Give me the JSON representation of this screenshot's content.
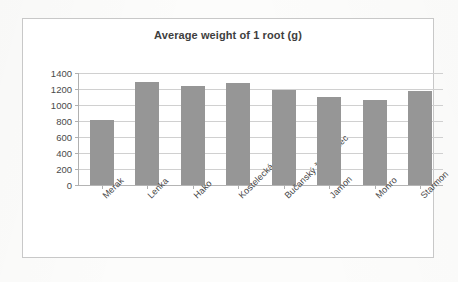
{
  "chart_data": {
    "type": "bar",
    "title": "Average weight of 1 root (g)",
    "xlabel": "",
    "ylabel": "",
    "ylim": [
      0,
      1400
    ],
    "ytick_step": 200,
    "ytick_labels": [
      "1400",
      "1200",
      "1000",
      "800",
      "600",
      "400",
      "200",
      "0"
    ],
    "grid": "horizontal",
    "legend": "none",
    "bar_color": "#969696",
    "categories": [
      "Merak",
      "Lenka",
      "Hako",
      "Kostelecká Barres",
      "Bučanský žlutý válec",
      "Jamon",
      "Monro",
      "Starmon"
    ],
    "values": [
      810,
      1290,
      1235,
      1270,
      1185,
      1100,
      1060,
      1170
    ]
  },
  "colors": {
    "bar": "#969696",
    "frame": "#c8c8c8",
    "gridline": "#d0d0d0",
    "axis": "#b0b0b0",
    "title_text": "#3e3e3e",
    "label_text": "#454545",
    "page_background": "#fcfcfb",
    "plot_background": "#ffffff"
  }
}
